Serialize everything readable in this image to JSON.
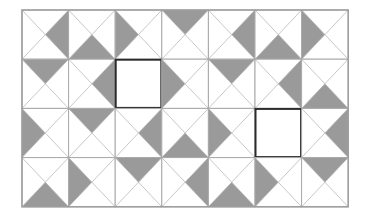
{
  "figure": {
    "name": "pinwheel-triangle-tiling-puzzle",
    "columns": 7,
    "rows": 4,
    "cell_width": 46.6,
    "cell_height": 49.2,
    "origin_x": 22,
    "origin_y": 10,
    "colors": {
      "background": "#ffffff",
      "shaded_triangle": "#9a9a9a",
      "diagonal_line": "#b9b9b9",
      "cell_border": "#a8a8a8",
      "outer_border": "#9c9c9c",
      "highlight_border": "#2b2b2b",
      "blank_fill": "#ffffff"
    },
    "line_widths": {
      "diagonal": 0.8,
      "cell_border": 1,
      "outer_border": 1.4,
      "highlight_border": 2
    }
  },
  "cells": [
    {
      "row": 0,
      "col": 0,
      "shaded": "right",
      "highlighted": false
    },
    {
      "row": 0,
      "col": 1,
      "shaded": "bottom",
      "highlighted": false
    },
    {
      "row": 0,
      "col": 2,
      "shaded": "left",
      "highlighted": false
    },
    {
      "row": 0,
      "col": 3,
      "shaded": "top",
      "highlighted": false
    },
    {
      "row": 0,
      "col": 4,
      "shaded": "right",
      "highlighted": false
    },
    {
      "row": 0,
      "col": 5,
      "shaded": "bottom",
      "highlighted": false
    },
    {
      "row": 0,
      "col": 6,
      "shaded": "left",
      "highlighted": false
    },
    {
      "row": 1,
      "col": 0,
      "shaded": "top",
      "highlighted": false
    },
    {
      "row": 1,
      "col": 1,
      "shaded": "right",
      "highlighted": false
    },
    {
      "row": 1,
      "col": 2,
      "shaded": "none",
      "highlighted": true
    },
    {
      "row": 1,
      "col": 3,
      "shaded": "left",
      "highlighted": false
    },
    {
      "row": 1,
      "col": 4,
      "shaded": "top",
      "highlighted": false
    },
    {
      "row": 1,
      "col": 5,
      "shaded": "right",
      "highlighted": false
    },
    {
      "row": 1,
      "col": 6,
      "shaded": "bottom",
      "highlighted": false
    },
    {
      "row": 2,
      "col": 0,
      "shaded": "left",
      "highlighted": false
    },
    {
      "row": 2,
      "col": 1,
      "shaded": "top",
      "highlighted": false
    },
    {
      "row": 2,
      "col": 2,
      "shaded": "right",
      "highlighted": false
    },
    {
      "row": 2,
      "col": 3,
      "shaded": "bottom",
      "highlighted": false
    },
    {
      "row": 2,
      "col": 4,
      "shaded": "left",
      "highlighted": false
    },
    {
      "row": 2,
      "col": 5,
      "shaded": "none",
      "highlighted": true
    },
    {
      "row": 2,
      "col": 6,
      "shaded": "right",
      "highlighted": false
    },
    {
      "row": 3,
      "col": 0,
      "shaded": "bottom",
      "highlighted": false
    },
    {
      "row": 3,
      "col": 1,
      "shaded": "left",
      "highlighted": false
    },
    {
      "row": 3,
      "col": 2,
      "shaded": "top",
      "highlighted": false
    },
    {
      "row": 3,
      "col": 3,
      "shaded": "right",
      "highlighted": false
    },
    {
      "row": 3,
      "col": 4,
      "shaded": "bottom",
      "highlighted": false
    },
    {
      "row": 3,
      "col": 5,
      "shaded": "left",
      "highlighted": false
    },
    {
      "row": 3,
      "col": 6,
      "shaded": "top",
      "highlighted": false
    }
  ]
}
